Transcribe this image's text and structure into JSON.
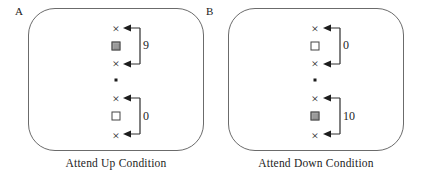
{
  "figure": {
    "panels": [
      {
        "label": "A",
        "caption": "Attend Up Condition",
        "groups": [
          {
            "position": "upper",
            "target": "filled",
            "value": "9"
          },
          {
            "position": "lower",
            "target": "open",
            "value": "0"
          }
        ]
      },
      {
        "label": "B",
        "caption": "Attend Down Condition",
        "groups": [
          {
            "position": "upper",
            "target": "open",
            "value": "0"
          },
          {
            "position": "lower",
            "target": "filled",
            "value": "10"
          }
        ]
      }
    ],
    "symbols": {
      "distractor": "×"
    },
    "colors": {
      "line": "#2e2e2e",
      "arrow": "#1c1c1c",
      "frame_border": "#6b6b6b",
      "filled_square": "#9a9a9a",
      "background": "#ffffff"
    }
  }
}
